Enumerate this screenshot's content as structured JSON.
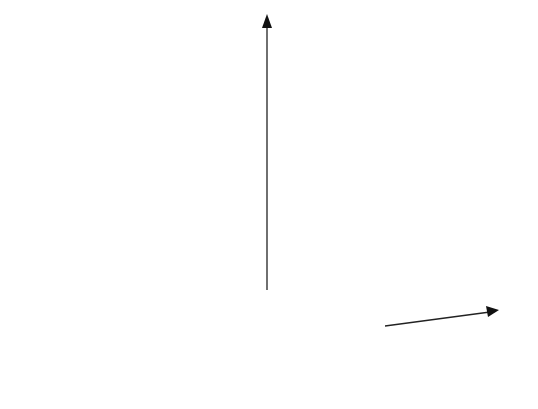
{
  "figure": {
    "type": "3d-surface",
    "axes": {
      "z_label": "z",
      "x_label": "x"
    },
    "colors": {
      "surface_fill": "#8a8a8a",
      "mesh_line": "#1a1a1a",
      "axis": "#222222",
      "background": "#ffffff"
    }
  },
  "chart_data": {
    "type": "surface",
    "title": "",
    "xlabel": "x",
    "zlabel": "z",
    "peaks": [
      {
        "name": "left-peak",
        "relative_height": 1.0
      },
      {
        "name": "right-peak",
        "relative_height": 0.93
      }
    ],
    "grid": "on (wireframe mesh)"
  }
}
